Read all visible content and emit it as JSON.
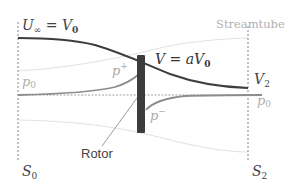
{
  "diagram": {
    "labels": {
      "u_inf": "U",
      "u_inf_sub": "∞",
      "u_inf_eq": "= V",
      "u_inf_eq_sub": "0",
      "streamtube": "Streamtube",
      "v_disc": "V = aV",
      "v_disc_sub": "0",
      "v2": "V",
      "v2_sub": "2",
      "p0_left": "p",
      "p0_left_sub": "0",
      "p0_right": "p",
      "p0_right_sub": "0",
      "p_plus": "p",
      "p_plus_sup": "+",
      "p_minus": "p",
      "p_minus_sup": "−",
      "rotor": "Rotor",
      "s0": "S",
      "s0_sub": "0",
      "s2": "S",
      "s2_sub": "2"
    },
    "colors": {
      "velocity_line": "#3a3a3a",
      "pressure_line": "#8a8a8a",
      "streamtube_line": "#e4e4e4",
      "rotor": "#3c3c3c",
      "dashed": "#555555",
      "label_dark": "#333333",
      "label_light": "#aaaaaa"
    }
  }
}
